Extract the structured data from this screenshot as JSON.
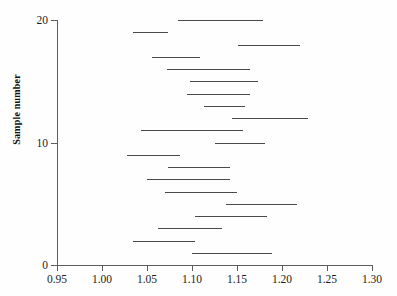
{
  "chart_data": {
    "type": "line",
    "title": "",
    "subtitle": "",
    "xlabel": "",
    "ylabel": "Sample number",
    "xlim": [
      0.95,
      1.3
    ],
    "ylim": [
      0,
      20
    ],
    "grid": false,
    "legend": null,
    "annotations": [],
    "x_ticks": [
      {
        "value": 0.95,
        "label": "0.95"
      },
      {
        "value": 1.0,
        "label": "1.00"
      },
      {
        "value": 1.05,
        "label": "1.05"
      },
      {
        "value": 1.1,
        "label": "1.10"
      },
      {
        "value": 1.15,
        "label": "1.15"
      },
      {
        "value": 1.2,
        "label": "1.20"
      },
      {
        "value": 1.25,
        "label": "1.25"
      },
      {
        "value": 1.3,
        "label": "1.30"
      }
    ],
    "y_ticks": [
      {
        "value": 0,
        "label": "0"
      },
      {
        "value": 10,
        "label": "10"
      },
      {
        "value": 20,
        "label": "20"
      }
    ],
    "series": [
      {
        "name": "confidence interval",
        "orientation": "horizontal",
        "intervals": [
          {
            "sample": 20,
            "low": 1.084,
            "high": 1.179
          },
          {
            "sample": 19,
            "low": 1.034,
            "high": 1.073
          },
          {
            "sample": 18,
            "low": 1.151,
            "high": 1.22
          },
          {
            "sample": 17,
            "low": 1.056,
            "high": 1.109
          },
          {
            "sample": 16,
            "low": 1.072,
            "high": 1.164
          },
          {
            "sample": 15,
            "low": 1.098,
            "high": 1.173
          },
          {
            "sample": 14,
            "low": 1.094,
            "high": 1.164
          },
          {
            "sample": 13,
            "low": 1.113,
            "high": 1.159
          },
          {
            "sample": 12,
            "low": 1.144,
            "high": 1.229
          },
          {
            "sample": 11,
            "low": 1.043,
            "high": 1.157
          },
          {
            "sample": 10,
            "low": 1.126,
            "high": 1.181
          },
          {
            "sample": 9,
            "low": 1.028,
            "high": 1.087
          },
          {
            "sample": 8,
            "low": 1.073,
            "high": 1.142
          },
          {
            "sample": 7,
            "low": 1.05,
            "high": 1.142
          },
          {
            "sample": 6,
            "low": 1.07,
            "high": 1.15
          },
          {
            "sample": 5,
            "low": 1.138,
            "high": 1.217
          },
          {
            "sample": 4,
            "low": 1.103,
            "high": 1.183
          },
          {
            "sample": 3,
            "low": 1.062,
            "high": 1.133
          },
          {
            "sample": 2,
            "low": 1.034,
            "high": 1.103
          },
          {
            "sample": 1,
            "low": 1.1,
            "high": 1.189
          }
        ]
      }
    ],
    "colors": {
      "segment": "#4a4a4a",
      "axis": "#5d5d5d",
      "text": "#1c1c1c",
      "background": "#fefefe"
    }
  }
}
